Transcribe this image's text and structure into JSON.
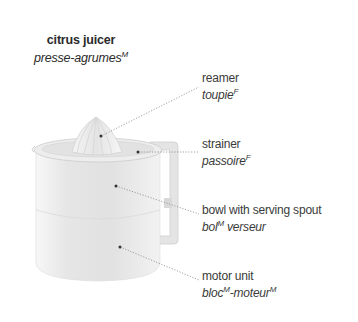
{
  "title": {
    "english": "citrus juicer",
    "french": "presse-agrumes",
    "french_gender": "M"
  },
  "parts": [
    {
      "english": "reamer",
      "french": "toupie",
      "french_gender": "F"
    },
    {
      "english": "strainer",
      "french": "passoire",
      "french_gender": "F"
    },
    {
      "english": "bowl with serving spout",
      "french_part1": "bol",
      "gender1": "M",
      "french_part2": " verseur"
    },
    {
      "english": "motor unit",
      "french_part1": "bloc",
      "gender1": "M",
      "french_part2": "-moteur",
      "gender2": "M"
    }
  ],
  "colors": {
    "text": "#3a3a3a",
    "leader_line": "#8a8a8a",
    "dot": "#333333",
    "body_fill": "#e9e9e9"
  }
}
